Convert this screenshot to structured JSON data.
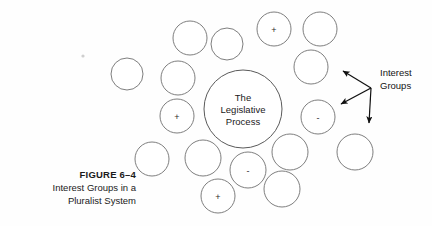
{
  "figure": {
    "caption_number": "FIGURE 6–4",
    "caption_line1": "Interest Groups in a",
    "caption_line2": "Pluralist System"
  },
  "core": {
    "line1": "The",
    "line2": "Legislative",
    "line3": "Process",
    "cx": 243,
    "cy": 109,
    "r": 39
  },
  "callout": {
    "label_line1": "Interest",
    "label_line2": "Groups",
    "label_x": 380,
    "label_y1": 76,
    "label_y2": 89,
    "hub_x": 371,
    "hub_y": 88,
    "arrows": [
      {
        "name": "arrow-up-left",
        "x2": 343,
        "y2": 71
      },
      {
        "name": "arrow-down-left",
        "x2": 341,
        "y2": 104
      },
      {
        "name": "arrow-down",
        "x2": 369,
        "y2": 123
      }
    ]
  },
  "groups": [
    {
      "name": "group-top-left-a",
      "cx": 190,
      "cy": 38,
      "r": 17,
      "sign": ""
    },
    {
      "name": "group-top-left-b",
      "cx": 227,
      "cy": 44,
      "r": 16,
      "sign": ""
    },
    {
      "name": "group-top-plus",
      "cx": 274,
      "cy": 29,
      "r": 17,
      "sign": "+"
    },
    {
      "name": "group-top-right",
      "cx": 320,
      "cy": 29,
      "r": 17,
      "sign": ""
    },
    {
      "name": "group-far-left",
      "cx": 127,
      "cy": 74,
      "r": 16,
      "sign": ""
    },
    {
      "name": "group-left-upper",
      "cx": 178,
      "cy": 78,
      "r": 17,
      "sign": ""
    },
    {
      "name": "group-right-upper",
      "cx": 311,
      "cy": 67,
      "r": 17,
      "sign": ""
    },
    {
      "name": "group-left-plus",
      "cx": 177,
      "cy": 116,
      "r": 17,
      "sign": "+"
    },
    {
      "name": "group-right-minus",
      "cx": 318,
      "cy": 117,
      "r": 17,
      "sign": "-"
    },
    {
      "name": "group-bottom-left-a",
      "cx": 152,
      "cy": 159,
      "r": 17,
      "sign": ""
    },
    {
      "name": "group-bottom-left-b",
      "cx": 203,
      "cy": 158,
      "r": 18,
      "sign": ""
    },
    {
      "name": "group-bottom-right-a",
      "cx": 290,
      "cy": 152,
      "r": 18,
      "sign": ""
    },
    {
      "name": "group-far-right-lower",
      "cx": 355,
      "cy": 152,
      "r": 18,
      "sign": ""
    },
    {
      "name": "group-bottom-minus",
      "cx": 248,
      "cy": 170,
      "r": 18,
      "sign": "-"
    },
    {
      "name": "group-bottom-plus",
      "cx": 218,
      "cy": 196,
      "r": 17,
      "sign": "+"
    },
    {
      "name": "group-bottom-center-right",
      "cx": 282,
      "cy": 189,
      "r": 18,
      "sign": ""
    }
  ],
  "colors": {
    "circle_stroke": "#6f6f6f",
    "core_stroke": "#5a5a5a",
    "arrow": "#111111",
    "text": "#1a1a1a",
    "background": "#ffffff"
  }
}
